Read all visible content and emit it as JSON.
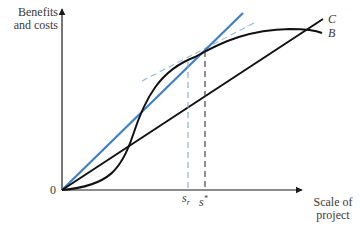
{
  "figure": {
    "y_axis_label_line1": "Benefits",
    "y_axis_label_line2": "and costs",
    "x_axis_label_line1": "Scale of",
    "x_axis_label_line2": "project",
    "origin_label": "0",
    "curve_labels": {
      "cost": "C",
      "benefit": "B"
    },
    "markers": {
      "s_r_base": "s",
      "s_r_sub": "r",
      "s_star_base": "s",
      "s_star_sup": "*"
    }
  },
  "colors": {
    "axis": "#1a1a1a",
    "curve": "#111111",
    "ray": "#3f7fc4",
    "tangent_dashed": "#8fb8de",
    "sr_dashed": "#7fa9d6",
    "sstar_dashed": "#333333"
  },
  "elements": {
    "benefit_curve": "S-shaped benefit curve B starting at origin, rising steeply, flattening near the top",
    "cost_line": "Straight cost line C from origin",
    "ray_from_origin": "Blue ray from origin tangent to B at s_r",
    "tangent_at_s_star": "Dashed line tangent to B at s* parallel to C",
    "vertical_s_r": "Blue dashed drop line at s_r",
    "vertical_s_star": "Black dashed drop line at s*"
  }
}
